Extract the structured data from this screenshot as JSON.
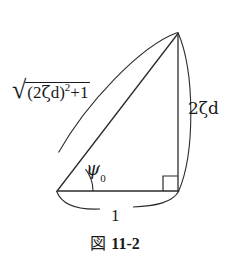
{
  "figure": {
    "caption_prefix": "図",
    "caption_number": "11-2",
    "background_color": "#ffffff",
    "stroke_color": "#2b2b2b",
    "labels": {
      "hypotenuse": {
        "full_text": "√((2ζd)²+1)",
        "radical_symbol": "√",
        "open_paren": "(",
        "coefficient": "2",
        "zeta": "ζ",
        "d": "d",
        "close_paren": ")",
        "exponent": "2",
        "plus_one": "+1"
      },
      "vertical_side": "2ζd",
      "base_side": "1",
      "angle": {
        "symbol": "ψ",
        "subscript": "0"
      }
    },
    "geometry": {
      "vertex_bottom_left": [
        57,
        191
      ],
      "vertex_bottom_right": [
        178,
        191
      ],
      "vertex_apex": [
        178,
        33
      ],
      "right_angle_at": "bottom-right",
      "angle_marked_at": "bottom-left"
    }
  }
}
